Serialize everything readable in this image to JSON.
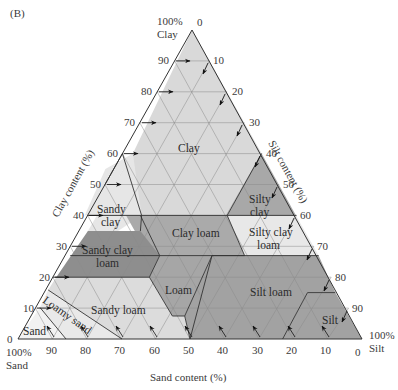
{
  "panel_label": "(B)",
  "corners": {
    "clay": [
      "100%",
      "Clay"
    ],
    "sand": [
      "100%",
      "Sand"
    ],
    "silt": [
      "100%",
      "Silt"
    ]
  },
  "axes": {
    "clay": {
      "title": "Clay content (%)",
      "ticks": [
        "0",
        "10",
        "20",
        "30",
        "40",
        "50",
        "60",
        "70",
        "80",
        "90"
      ]
    },
    "silt": {
      "title": "Silt content (%)",
      "ticks": [
        "0",
        "10",
        "20",
        "30",
        "40",
        "50",
        "60",
        "70",
        "80",
        "90"
      ]
    },
    "sand": {
      "title": "Sand content (%)",
      "ticks": [
        "90",
        "80",
        "70",
        "60",
        "50",
        "40",
        "30",
        "20",
        "10",
        "0"
      ]
    },
    "top_zero": "0",
    "bottom_left_zero": "0"
  },
  "regions": [
    {
      "name": "Clay",
      "lines": [
        "Clay"
      ],
      "color": "#d9d9d9"
    },
    {
      "name": "Sandy clay",
      "lines": [
        "Sandy",
        "clay"
      ],
      "color": "#e6e6e6"
    },
    {
      "name": "Silty clay",
      "lines": [
        "Silty",
        "clay"
      ],
      "color": "#a8a8a8"
    },
    {
      "name": "Clay loam",
      "lines": [
        "Clay loam"
      ],
      "color": "#aaaaaa"
    },
    {
      "name": "Silty clay loam",
      "lines": [
        "Silty clay",
        "loam"
      ],
      "color": "#e8e8e8"
    },
    {
      "name": "Sandy clay loam",
      "lines": [
        "Sandy clay",
        "loam"
      ],
      "color": "#8e8e8e"
    },
    {
      "name": "Loam",
      "lines": [
        "Loam"
      ],
      "color": "#a6a6a6"
    },
    {
      "name": "Silt loam",
      "lines": [
        "Silt loam"
      ],
      "color": "#a2a2a2"
    },
    {
      "name": "Sandy loam",
      "lines": [
        "Sandy loam"
      ],
      "color": "#dcdcdc"
    },
    {
      "name": "Loamy sand",
      "lines": [
        "Loamy sand"
      ],
      "color": "#e9e9e9"
    },
    {
      "name": "Sand",
      "lines": [
        "Sand"
      ],
      "color": "#f2f2f2"
    },
    {
      "name": "Silt",
      "lines": [
        "Silt"
      ],
      "color": "#a2a2a2"
    }
  ]
}
